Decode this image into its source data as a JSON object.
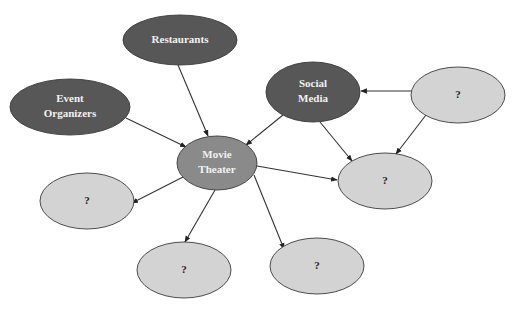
{
  "diagram": {
    "type": "concept-map",
    "colors": {
      "dark_node": "#575757",
      "center_node": "#8a8a8a",
      "unknown_node": "#d3d3d3",
      "node_stroke": "#3a3a3a",
      "edge": "#333333",
      "background": "#ffffff"
    },
    "nodes": [
      {
        "id": "restaurants",
        "lines": [
          "Restaurants"
        ],
        "style": "dark",
        "cx": 180,
        "cy": 40,
        "rx": 57,
        "ry": 25
      },
      {
        "id": "event_organizers",
        "lines": [
          "Event",
          "Organizers"
        ],
        "style": "dark",
        "cx": 70,
        "cy": 107,
        "rx": 60,
        "ry": 28
      },
      {
        "id": "social_media",
        "lines": [
          "Social",
          "Media"
        ],
        "style": "dark",
        "cx": 313,
        "cy": 92,
        "rx": 47,
        "ry": 30
      },
      {
        "id": "movie_theater",
        "lines": [
          "Movie",
          "Theater"
        ],
        "style": "center",
        "cx": 217,
        "cy": 163,
        "rx": 40,
        "ry": 27
      },
      {
        "id": "unknown_top_right",
        "lines": [
          "?"
        ],
        "style": "unknown",
        "cx": 458,
        "cy": 95,
        "rx": 47,
        "ry": 28
      },
      {
        "id": "unknown_right",
        "lines": [
          "?"
        ],
        "style": "unknown",
        "cx": 385,
        "cy": 181,
        "rx": 47,
        "ry": 28
      },
      {
        "id": "unknown_left",
        "lines": [
          "?"
        ],
        "style": "unknown",
        "cx": 87,
        "cy": 201,
        "rx": 47,
        "ry": 28
      },
      {
        "id": "unknown_bottom_left",
        "lines": [
          "?"
        ],
        "style": "unknown",
        "cx": 184,
        "cy": 270,
        "rx": 47,
        "ry": 28
      },
      {
        "id": "unknown_bottom_mid",
        "lines": [
          "?"
        ],
        "style": "unknown",
        "cx": 317,
        "cy": 266,
        "rx": 47,
        "ry": 28
      }
    ],
    "edges": [
      {
        "from": "restaurants",
        "to": "movie_theater",
        "x1": 178,
        "y1": 65,
        "x2": 208,
        "y2": 136
      },
      {
        "from": "event_organizers",
        "to": "movie_theater",
        "x1": 126,
        "y1": 118,
        "x2": 186,
        "y2": 147
      },
      {
        "from": "social_media",
        "to": "movie_theater",
        "x1": 283,
        "y1": 115,
        "x2": 246,
        "y2": 145
      },
      {
        "from": "social_media",
        "to": "unknown_right",
        "x1": 320,
        "y1": 122,
        "x2": 352,
        "y2": 161
      },
      {
        "from": "unknown_top_right",
        "to": "social_media",
        "x1": 412,
        "y1": 91,
        "x2": 361,
        "y2": 91
      },
      {
        "from": "unknown_top_right",
        "to": "unknown_right",
        "x1": 426,
        "y1": 115,
        "x2": 396,
        "y2": 154
      },
      {
        "from": "movie_theater",
        "to": "unknown_right",
        "x1": 257,
        "y1": 166,
        "x2": 337,
        "y2": 180
      },
      {
        "from": "movie_theater",
        "to": "unknown_left",
        "x1": 183,
        "y1": 177,
        "x2": 132,
        "y2": 203
      },
      {
        "from": "movie_theater",
        "to": "unknown_bottom_left",
        "x1": 215,
        "y1": 190,
        "x2": 185,
        "y2": 242
      },
      {
        "from": "movie_theater",
        "to": "unknown_bottom_mid",
        "x1": 254,
        "y1": 175,
        "x2": 284,
        "y2": 249
      }
    ]
  }
}
